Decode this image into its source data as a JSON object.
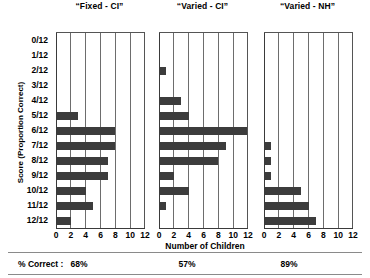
{
  "chart_data": {
    "type": "bar",
    "orientation": "horizontal",
    "title": "",
    "xlabel": "Number of Children",
    "ylabel": "Score (Proportion Correct)",
    "xlim": [
      0,
      12
    ],
    "xticks": [
      0,
      2,
      4,
      6,
      8,
      10,
      12
    ],
    "xticklabels": [
      "0",
      "2",
      "4",
      "6",
      "8",
      "10",
      "12"
    ],
    "grid": "vertical",
    "legend": "none",
    "categories": [
      "0/12",
      "1/12",
      "2/12",
      "3/12",
      "4/12",
      "5/12",
      "6/12",
      "7/12",
      "8/12",
      "9/12",
      "10/12",
      "11/12",
      "12/12"
    ],
    "panels": [
      {
        "title": "“Fixed - CI”",
        "values": [
          0,
          0,
          0,
          0,
          0,
          3,
          8,
          8,
          7,
          7,
          4,
          5,
          2
        ],
        "percent_correct": "68%"
      },
      {
        "title": "“Varied - CI”",
        "values": [
          0,
          0,
          1,
          0,
          3,
          4,
          12,
          9,
          8,
          2,
          4,
          1,
          0
        ],
        "percent_correct": "57%"
      },
      {
        "title": "“Varied - NH”",
        "values": [
          0,
          0,
          0,
          0,
          0,
          0,
          0,
          1,
          1,
          1,
          5,
          6,
          7
        ],
        "percent_correct": "89%"
      }
    ],
    "bar_color": "#3c3c3c",
    "gridline_color": "#6d6d6d"
  },
  "footer": {
    "label": "% Correct :",
    "values": [
      "68%",
      "57%",
      "89%"
    ]
  }
}
